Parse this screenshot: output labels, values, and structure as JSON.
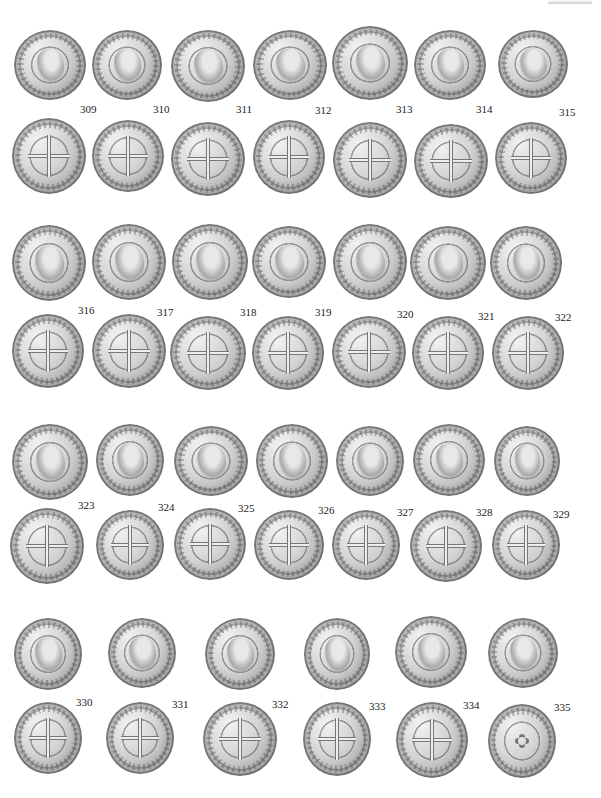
{
  "plate": {
    "coins": [
      {
        "id": "309",
        "label": "309",
        "face": "obv",
        "x": 14,
        "y": 30,
        "w": 72,
        "h": 70,
        "lx": 80,
        "ly": 104
      },
      {
        "id": "310",
        "label": "310",
        "face": "obv",
        "x": 92,
        "y": 30,
        "w": 70,
        "h": 70,
        "lx": 153,
        "ly": 104
      },
      {
        "id": "311",
        "label": "311",
        "face": "obv",
        "x": 171,
        "y": 30,
        "w": 74,
        "h": 72,
        "lx": 236,
        "ly": 104
      },
      {
        "id": "312",
        "label": "312",
        "face": "obv",
        "x": 253,
        "y": 30,
        "w": 74,
        "h": 70,
        "lx": 315,
        "ly": 105
      },
      {
        "id": "313",
        "label": "313",
        "face": "obv",
        "x": 332,
        "y": 26,
        "w": 76,
        "h": 74,
        "lx": 396,
        "ly": 104
      },
      {
        "id": "314",
        "label": "314",
        "face": "obv",
        "x": 414,
        "y": 30,
        "w": 72,
        "h": 70,
        "lx": 476,
        "ly": 104
      },
      {
        "id": "315",
        "label": "315",
        "face": "obv",
        "x": 498,
        "y": 30,
        "w": 70,
        "h": 68,
        "lx": 559,
        "ly": 107
      },
      {
        "id": "309r",
        "label": "",
        "face": "rev",
        "x": 12,
        "y": 118,
        "w": 74,
        "h": 76,
        "lx": 0,
        "ly": 0
      },
      {
        "id": "310r",
        "label": "",
        "face": "rev",
        "x": 92,
        "y": 120,
        "w": 72,
        "h": 72,
        "lx": 0,
        "ly": 0
      },
      {
        "id": "311r",
        "label": "",
        "face": "rev",
        "x": 171,
        "y": 122,
        "w": 74,
        "h": 74,
        "lx": 0,
        "ly": 0
      },
      {
        "id": "312r",
        "label": "",
        "face": "rev",
        "x": 253,
        "y": 120,
        "w": 72,
        "h": 74,
        "lx": 0,
        "ly": 0
      },
      {
        "id": "313r",
        "label": "",
        "face": "rev",
        "x": 333,
        "y": 122,
        "w": 74,
        "h": 76,
        "lx": 0,
        "ly": 0
      },
      {
        "id": "314r",
        "label": "",
        "face": "rev",
        "x": 414,
        "y": 124,
        "w": 74,
        "h": 74,
        "lx": 0,
        "ly": 0
      },
      {
        "id": "315r",
        "label": "",
        "face": "rev",
        "x": 495,
        "y": 122,
        "w": 72,
        "h": 72,
        "lx": 0,
        "ly": 0
      },
      {
        "id": "316",
        "label": "316",
        "face": "obv",
        "x": 12,
        "y": 225,
        "w": 74,
        "h": 76,
        "lx": 78,
        "ly": 305
      },
      {
        "id": "317",
        "label": "317",
        "face": "obv",
        "x": 92,
        "y": 224,
        "w": 74,
        "h": 76,
        "lx": 157,
        "ly": 307
      },
      {
        "id": "318",
        "label": "318",
        "face": "obv",
        "x": 172,
        "y": 224,
        "w": 76,
        "h": 76,
        "lx": 240,
        "ly": 307
      },
      {
        "id": "319",
        "label": "319",
        "face": "obv",
        "x": 252,
        "y": 226,
        "w": 74,
        "h": 72,
        "lx": 315,
        "ly": 307
      },
      {
        "id": "320",
        "label": "320",
        "face": "obv",
        "x": 333,
        "y": 224,
        "w": 74,
        "h": 76,
        "lx": 397,
        "ly": 309
      },
      {
        "id": "321",
        "label": "321",
        "face": "obv",
        "x": 410,
        "y": 226,
        "w": 76,
        "h": 74,
        "lx": 478,
        "ly": 311
      },
      {
        "id": "322",
        "label": "322",
        "face": "obv",
        "x": 490,
        "y": 226,
        "w": 72,
        "h": 74,
        "lx": 555,
        "ly": 312
      },
      {
        "id": "316r",
        "label": "",
        "face": "rev",
        "x": 12,
        "y": 314,
        "w": 72,
        "h": 74,
        "lx": 0,
        "ly": 0
      },
      {
        "id": "317r",
        "label": "",
        "face": "rev",
        "x": 92,
        "y": 314,
        "w": 74,
        "h": 74,
        "lx": 0,
        "ly": 0
      },
      {
        "id": "318r",
        "label": "",
        "face": "rev",
        "x": 170,
        "y": 316,
        "w": 76,
        "h": 74,
        "lx": 0,
        "ly": 0
      },
      {
        "id": "319r",
        "label": "",
        "face": "rev",
        "x": 252,
        "y": 316,
        "w": 72,
        "h": 74,
        "lx": 0,
        "ly": 0
      },
      {
        "id": "320r",
        "label": "",
        "face": "rev",
        "x": 332,
        "y": 316,
        "w": 74,
        "h": 72,
        "lx": 0,
        "ly": 0
      },
      {
        "id": "321r",
        "label": "",
        "face": "rev",
        "x": 412,
        "y": 316,
        "w": 72,
        "h": 74,
        "lx": 0,
        "ly": 0
      },
      {
        "id": "322r",
        "label": "",
        "face": "rev",
        "x": 492,
        "y": 316,
        "w": 72,
        "h": 74,
        "lx": 0,
        "ly": 0
      },
      {
        "id": "323",
        "label": "323",
        "face": "obv",
        "x": 12,
        "y": 424,
        "w": 76,
        "h": 76,
        "lx": 78,
        "ly": 500
      },
      {
        "id": "324",
        "label": "324",
        "face": "obv",
        "x": 96,
        "y": 424,
        "w": 68,
        "h": 72,
        "lx": 158,
        "ly": 502
      },
      {
        "id": "325",
        "label": "325",
        "face": "obv",
        "x": 174,
        "y": 426,
        "w": 74,
        "h": 70,
        "lx": 238,
        "ly": 503
      },
      {
        "id": "326",
        "label": "326",
        "face": "obv",
        "x": 256,
        "y": 424,
        "w": 72,
        "h": 74,
        "lx": 318,
        "ly": 505
      },
      {
        "id": "327",
        "label": "327",
        "face": "obv",
        "x": 336,
        "y": 426,
        "w": 68,
        "h": 70,
        "lx": 397,
        "ly": 507
      },
      {
        "id": "328",
        "label": "328",
        "face": "obv",
        "x": 413,
        "y": 424,
        "w": 72,
        "h": 72,
        "lx": 476,
        "ly": 507
      },
      {
        "id": "329",
        "label": "329",
        "face": "obv",
        "x": 494,
        "y": 426,
        "w": 66,
        "h": 70,
        "lx": 553,
        "ly": 509
      },
      {
        "id": "323r",
        "label": "",
        "face": "rev",
        "x": 10,
        "y": 508,
        "w": 74,
        "h": 76,
        "lx": 0,
        "ly": 0
      },
      {
        "id": "324r",
        "label": "",
        "face": "rev",
        "x": 96,
        "y": 510,
        "w": 68,
        "h": 70,
        "lx": 0,
        "ly": 0
      },
      {
        "id": "325r",
        "label": "",
        "face": "rev",
        "x": 174,
        "y": 508,
        "w": 72,
        "h": 72,
        "lx": 0,
        "ly": 0
      },
      {
        "id": "326r",
        "label": "",
        "face": "rev",
        "x": 254,
        "y": 510,
        "w": 70,
        "h": 70,
        "lx": 0,
        "ly": 0
      },
      {
        "id": "327r",
        "label": "",
        "face": "rev",
        "x": 332,
        "y": 510,
        "w": 68,
        "h": 70,
        "lx": 0,
        "ly": 0
      },
      {
        "id": "328r",
        "label": "",
        "face": "rev",
        "x": 410,
        "y": 510,
        "w": 72,
        "h": 72,
        "lx": 0,
        "ly": 0
      },
      {
        "id": "329r",
        "label": "",
        "face": "rev",
        "x": 492,
        "y": 510,
        "w": 68,
        "h": 70,
        "lx": 0,
        "ly": 0
      },
      {
        "id": "330",
        "label": "330",
        "face": "obv",
        "x": 14,
        "y": 618,
        "w": 68,
        "h": 72,
        "lx": 76,
        "ly": 697
      },
      {
        "id": "331",
        "label": "331",
        "face": "obv",
        "x": 108,
        "y": 618,
        "w": 68,
        "h": 70,
        "lx": 172,
        "ly": 699
      },
      {
        "id": "332",
        "label": "332",
        "face": "obv",
        "x": 205,
        "y": 618,
        "w": 70,
        "h": 72,
        "lx": 272,
        "ly": 699
      },
      {
        "id": "333",
        "label": "333",
        "face": "obv",
        "x": 304,
        "y": 618,
        "w": 66,
        "h": 72,
        "lx": 369,
        "ly": 701
      },
      {
        "id": "334",
        "label": "334",
        "face": "obv",
        "x": 395,
        "y": 616,
        "w": 72,
        "h": 72,
        "lx": 463,
        "ly": 700
      },
      {
        "id": "335",
        "label": "335",
        "face": "obv",
        "x": 488,
        "y": 618,
        "w": 70,
        "h": 70,
        "lx": 554,
        "ly": 702
      },
      {
        "id": "330r",
        "label": "",
        "face": "rev",
        "x": 14,
        "y": 702,
        "w": 68,
        "h": 72,
        "lx": 0,
        "ly": 0
      },
      {
        "id": "331r",
        "label": "",
        "face": "rev",
        "x": 106,
        "y": 702,
        "w": 68,
        "h": 72,
        "lx": 0,
        "ly": 0
      },
      {
        "id": "332r",
        "label": "",
        "face": "rev",
        "x": 203,
        "y": 702,
        "w": 74,
        "h": 74,
        "lx": 0,
        "ly": 0
      },
      {
        "id": "333r",
        "label": "",
        "face": "rev",
        "x": 303,
        "y": 702,
        "w": 68,
        "h": 74,
        "lx": 0,
        "ly": 0
      },
      {
        "id": "334r",
        "label": "",
        "face": "rev",
        "x": 396,
        "y": 702,
        "w": 72,
        "h": 76,
        "lx": 0,
        "ly": 0
      },
      {
        "id": "335r",
        "label": "",
        "face": "star",
        "x": 488,
        "y": 704,
        "w": 68,
        "h": 74,
        "lx": 0,
        "ly": 0
      }
    ]
  }
}
